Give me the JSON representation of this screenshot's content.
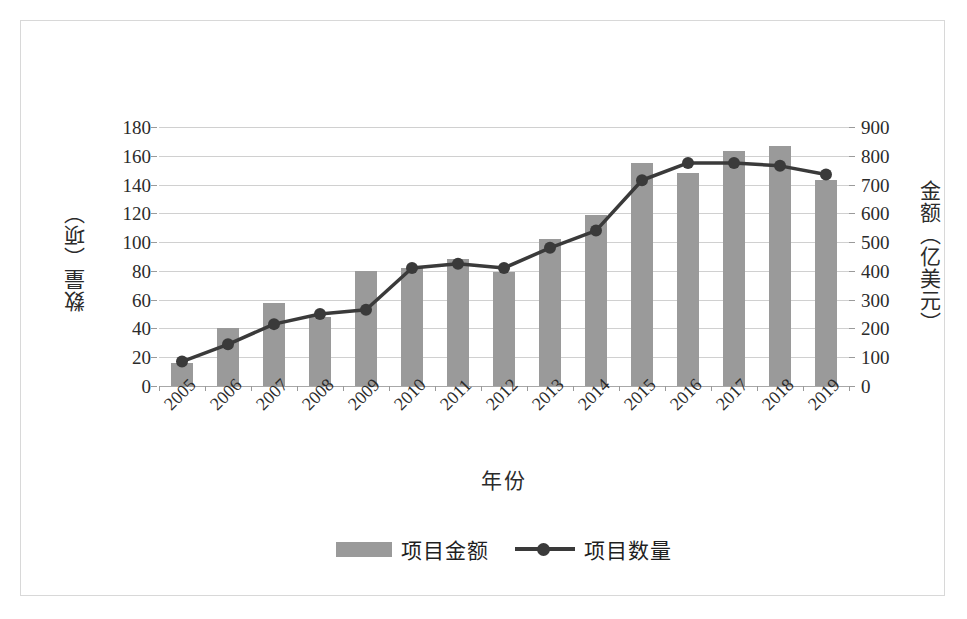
{
  "chart_data": {
    "type": "bar",
    "title": "",
    "xlabel": "年份",
    "categories": [
      "2005",
      "2006",
      "2007",
      "2008",
      "2009",
      "2010",
      "2011",
      "2012",
      "2013",
      "2014",
      "2015",
      "2016",
      "2017",
      "2018",
      "2019"
    ],
    "series": [
      {
        "name": "项目金额",
        "type": "bar",
        "axis": "right",
        "unit": "亿美元",
        "values": [
          80,
          200,
          290,
          240,
          400,
          410,
          440,
          395,
          510,
          595,
          775,
          740,
          815,
          835,
          715
        ]
      },
      {
        "name": "项目数量",
        "type": "line",
        "axis": "left",
        "unit": "项",
        "values": [
          17,
          29,
          43,
          50,
          53,
          82,
          85,
          82,
          96,
          108,
          143,
          155,
          155,
          153,
          147
        ]
      }
    ],
    "left_axis": {
      "label": "数量（项）",
      "ticks": [
        "0",
        "20",
        "40",
        "60",
        "80",
        "100",
        "120",
        "140",
        "160",
        "180"
      ],
      "min": 0,
      "max": 180,
      "step": 20
    },
    "right_axis": {
      "label": "金额（亿美元）",
      "ticks": [
        "0",
        "100",
        "200",
        "300",
        "400",
        "500",
        "600",
        "700",
        "800",
        "900"
      ],
      "min": 0,
      "max": 900,
      "step": 100
    },
    "grid": true,
    "legend_position": "bottom",
    "colors": {
      "bar": "#9a9a9a",
      "line": "#3a3a3a",
      "grid": "#d0d0d0",
      "text": "#2b2b2b",
      "border": "#d8d8d8",
      "background": "#ffffff"
    }
  },
  "legend": {
    "bar_label": "项目金额",
    "line_label": "项目数量"
  }
}
